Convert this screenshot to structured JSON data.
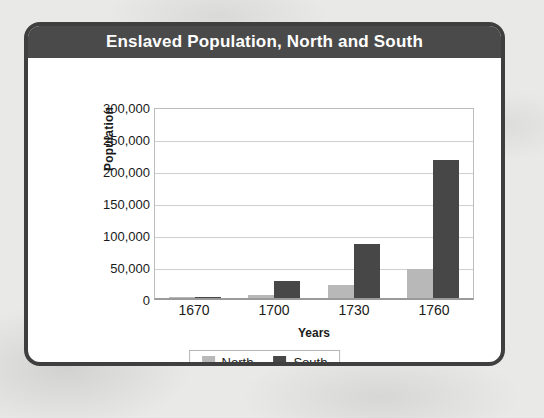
{
  "card": {
    "title": "Enslaved Population, North and South"
  },
  "colors": {
    "north": "#b8b8b8",
    "south": "#474747",
    "title_bar": "#4a4a4a",
    "card_border": "#3f3f3f",
    "page_background": "#e9e9e7"
  },
  "chart_data": {
    "type": "bar",
    "title": "Enslaved Population, North and South",
    "xlabel": "Years",
    "ylabel": "Population",
    "categories": [
      "1670",
      "1700",
      "1730",
      "1760"
    ],
    "series": [
      {
        "name": "North",
        "values": [
          500,
          5000,
          20000,
          45000
        ]
      },
      {
        "name": "South",
        "values": [
          2000,
          27000,
          85000,
          215000
        ]
      }
    ],
    "ylim": [
      0,
      300000
    ],
    "ytick_values": [
      0,
      50000,
      100000,
      150000,
      200000,
      250000,
      300000
    ],
    "ytick_labels": [
      "0",
      "50,000",
      "100,000",
      "150,000",
      "200,000",
      "250,000",
      "300,000"
    ],
    "grid": true,
    "legend_position": "bottom"
  }
}
